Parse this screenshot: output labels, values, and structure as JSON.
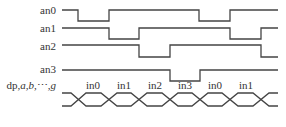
{
  "signals": [
    {
      "name": "an0",
      "label": "an0"
    },
    {
      "name": "an1",
      "label": "an1"
    },
    {
      "name": "an2",
      "label": "an2"
    },
    {
      "name": "an3",
      "label": "an3"
    }
  ],
  "bus": {
    "label_prefix": "dp,",
    "label_italic": "a,b,",
    "label_dots": "⋯",
    "label_suffix": ",g",
    "segments": [
      "in0",
      "in1",
      "in2",
      "in3",
      "in0",
      "in1"
    ]
  },
  "colors": {
    "line": "#444444",
    "text": "#333333",
    "background": "#ffffff"
  }
}
